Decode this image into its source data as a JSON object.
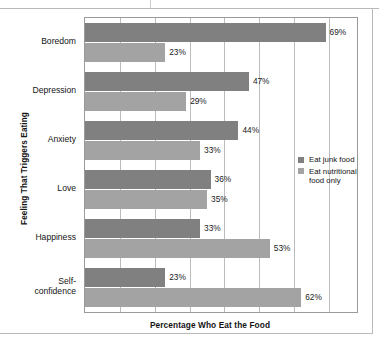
{
  "chart_data": {
    "type": "bar",
    "orientation": "horizontal",
    "title": "",
    "xlabel": "Percentage Who Eat the Food",
    "ylabel": "Feeling That Triggers Eating",
    "categories": [
      "Boredom",
      "Depression",
      "Anxiety",
      "Love",
      "Happiness",
      "Self-confidence"
    ],
    "series": [
      {
        "name": "Eat junk food",
        "color": "#808080",
        "values": [
          69,
          47,
          44,
          36,
          33,
          23
        ],
        "labels": [
          "69%",
          "47%",
          "44%",
          "36%",
          "33%",
          "23%"
        ]
      },
      {
        "name": "Eat nutritional food only",
        "color": "#a3a3a3",
        "values": [
          23,
          29,
          33,
          35,
          53,
          62
        ],
        "labels": [
          "23%",
          "29%",
          "33%",
          "35%",
          "53%",
          "62%"
        ]
      }
    ],
    "xlim": [
      0,
      78
    ],
    "gridlines": [
      10,
      20,
      30,
      40,
      50,
      60,
      70
    ],
    "grid": true,
    "legend_position": "middle-right"
  },
  "legend": {
    "items": [
      {
        "label": "Eat junk food"
      },
      {
        "label": "Eat nutritional food only"
      }
    ]
  },
  "axes": {
    "x_title": "Percentage Who Eat the Food",
    "y_title": "Feeling That Triggers Eating"
  }
}
